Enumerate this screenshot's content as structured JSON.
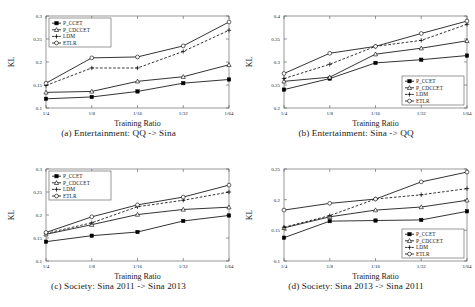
{
  "figure": {
    "name": "kl-divergence-training-ratio-figure",
    "panel_count": 4
  },
  "common": {
    "xlabel": "Training Ratio",
    "ylabel": "KL",
    "xticks": [
      "1/4",
      "1/8",
      "1/16",
      "1/32",
      "1/64"
    ],
    "series_names": [
      "P_CCET",
      "P_CDCCET",
      "LDM",
      "ETLR"
    ],
    "markers": [
      "filled-square",
      "open-triangle",
      "plus",
      "open-circle"
    ],
    "linestyles": [
      "solid",
      "solid",
      "dashed",
      "solid"
    ],
    "color": "#000000"
  },
  "panels": [
    {
      "id": "a",
      "caption": "(a) Entertainment: QQ -> Sina",
      "legend_position": "top-left",
      "chart_data": {
        "type": "line",
        "title": "(a) Entertainment: QQ -> Sina",
        "xlabel": "Training Ratio",
        "ylabel": "KL",
        "categories": [
          "1/4",
          "1/8",
          "1/16",
          "1/32",
          "1/64"
        ],
        "yticks": [
          0.1,
          0.15,
          0.2,
          0.25,
          0.3
        ],
        "ytick_labels": [
          "0.1",
          "0.15",
          "0.2",
          "0.25",
          "0.3"
        ],
        "ylim": [
          0.1,
          0.3
        ],
        "grid": false,
        "legend": "top-left",
        "series": [
          {
            "name": "P_CCET",
            "marker": "filled-square",
            "linestyle": "solid",
            "values": [
              0.12,
              0.124,
              0.136,
              0.154,
              0.162
            ]
          },
          {
            "name": "P_CDCCET",
            "marker": "open-triangle",
            "linestyle": "solid",
            "values": [
              0.134,
              0.136,
              0.158,
              0.168,
              0.194
            ]
          },
          {
            "name": "LDM",
            "marker": "plus",
            "linestyle": "dashed",
            "values": [
              0.149,
              0.187,
              0.187,
              0.223,
              0.269
            ]
          },
          {
            "name": "ETLR",
            "marker": "open-circle",
            "linestyle": "solid",
            "values": [
              0.154,
              0.209,
              0.211,
              0.235,
              0.287
            ]
          }
        ]
      }
    },
    {
      "id": "b",
      "caption": "(b) Entertainment: Sina -> QQ",
      "legend_position": "bottom-right",
      "chart_data": {
        "type": "line",
        "title": "(b) Entertainment: Sina -> QQ",
        "xlabel": "Training Ratio",
        "ylabel": "KL",
        "categories": [
          "1/4",
          "1/8",
          "1/16",
          "1/32",
          "1/64"
        ],
        "yticks": [
          0.2,
          0.25,
          0.3,
          0.35,
          0.4
        ],
        "ytick_labels": [
          "0.2",
          "0.25",
          "0.3",
          "0.35",
          "0.4"
        ],
        "ylim": [
          0.2,
          0.4
        ],
        "grid": false,
        "legend": "bottom-right",
        "series": [
          {
            "name": "P_CCET",
            "marker": "filled-square",
            "linestyle": "solid",
            "values": [
              0.24,
              0.264,
              0.298,
              0.305,
              0.314
            ]
          },
          {
            "name": "P_CDCCET",
            "marker": "open-triangle",
            "linestyle": "solid",
            "values": [
              0.258,
              0.267,
              0.317,
              0.33,
              0.346
            ]
          },
          {
            "name": "LDM",
            "marker": "plus",
            "linestyle": "dashed",
            "values": [
              0.264,
              0.295,
              0.334,
              0.347,
              0.382
            ]
          },
          {
            "name": "ETLR",
            "marker": "open-circle",
            "linestyle": "solid",
            "values": [
              0.275,
              0.319,
              0.334,
              0.362,
              0.389
            ]
          }
        ]
      }
    },
    {
      "id": "c",
      "caption": "(c) Society: Sina 2011 -> Sina 2013",
      "legend_position": "top-left",
      "chart_data": {
        "type": "line",
        "title": "(c) Society: Sina 2011 -> Sina 2013",
        "xlabel": "Training Ratio",
        "ylabel": "KL",
        "categories": [
          "1/4",
          "1/8",
          "1/16",
          "1/32",
          "1/64"
        ],
        "yticks": [
          0.1,
          0.15,
          0.2,
          0.25,
          0.3
        ],
        "ytick_labels": [
          "0.1",
          "0.15",
          "0.2",
          "0.25",
          "0.3"
        ],
        "ylim": [
          0.1,
          0.3
        ],
        "grid": false,
        "legend": "top-left",
        "series": [
          {
            "name": "P_CCET",
            "marker": "filled-square",
            "linestyle": "solid",
            "values": [
              0.142,
              0.155,
              0.163,
              0.187,
              0.199
            ]
          },
          {
            "name": "P_CDCCET",
            "marker": "open-triangle",
            "linestyle": "solid",
            "values": [
              0.158,
              0.179,
              0.201,
              0.212,
              0.217
            ]
          },
          {
            "name": "LDM",
            "marker": "plus",
            "linestyle": "dashed",
            "values": [
              0.16,
              0.183,
              0.218,
              0.232,
              0.25
            ]
          },
          {
            "name": "ETLR",
            "marker": "open-circle",
            "linestyle": "solid",
            "values": [
              0.162,
              0.196,
              0.222,
              0.239,
              0.265
            ]
          }
        ]
      }
    },
    {
      "id": "d",
      "caption": "(d) Society: Sina 2013 -> Sina 2011",
      "legend_position": "bottom-right",
      "chart_data": {
        "type": "line",
        "title": "(d) Society: Sina 2013 -> Sina 2011",
        "xlabel": "Training Ratio",
        "ylabel": "KL",
        "categories": [
          "1/4",
          "1/8",
          "1/16",
          "1/32",
          "1/64"
        ],
        "yticks": [
          0.1,
          0.15,
          0.2,
          0.25
        ],
        "ytick_labels": [
          "0.1",
          "0.15",
          "0.2",
          "0.25"
        ],
        "ylim": [
          0.1,
          0.25
        ],
        "grid": false,
        "legend": "bottom-right",
        "series": [
          {
            "name": "P_CCET",
            "marker": "filled-square",
            "linestyle": "solid",
            "values": [
              0.138,
              0.165,
              0.166,
              0.167,
              0.181
            ]
          },
          {
            "name": "P_CDCCET",
            "marker": "open-triangle",
            "linestyle": "solid",
            "values": [
              0.154,
              0.172,
              0.183,
              0.188,
              0.199
            ]
          },
          {
            "name": "LDM",
            "marker": "plus",
            "linestyle": "dashed",
            "values": [
              0.155,
              0.174,
              0.201,
              0.208,
              0.218
            ]
          },
          {
            "name": "ETLR",
            "marker": "open-circle",
            "linestyle": "solid",
            "values": [
              0.183,
              0.194,
              0.201,
              0.229,
              0.245
            ]
          }
        ]
      }
    }
  ]
}
